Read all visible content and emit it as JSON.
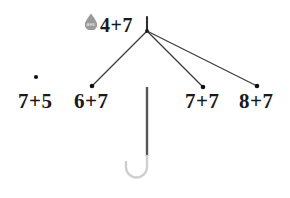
{
  "canvas": {
    "width": 290,
    "height": 198,
    "background": "#ffffff"
  },
  "colors": {
    "ink": "#1a1a1a",
    "branch": "#3a3a3a",
    "node": "#111111",
    "handle_shaft": "#555555",
    "handle_hook": "#cfcfcf",
    "droplet": "#9a9a9a",
    "droplet_label": "#ffffff"
  },
  "worksheet": {
    "title": "4+7",
    "root": {
      "label": "4+7",
      "x": 121,
      "y": 33
    },
    "icon": {
      "name": "water-droplet-icon",
      "label": "ARK",
      "x": 91,
      "y": 21
    },
    "vertex": {
      "x": 147,
      "y": 31
    },
    "top_stem": {
      "x": 147,
      "y1": 17,
      "y2": 31
    },
    "branches": [
      {
        "from_x": 147,
        "from_y": 31,
        "to_x": 92,
        "to_y": 86
      },
      {
        "from_x": 147,
        "from_y": 31,
        "to_x": 203,
        "to_y": 87
      },
      {
        "from_x": 147,
        "from_y": 31,
        "to_x": 257,
        "to_y": 86
      }
    ],
    "nodes": [
      {
        "label": "7+5",
        "dot_x": 36,
        "dot_y": 77,
        "text_x": 18,
        "text_y": 105,
        "connected": false
      },
      {
        "label": "6+7",
        "dot_x": 92,
        "dot_y": 86,
        "text_x": 74,
        "text_y": 105,
        "connected": true
      },
      {
        "label": "7+7",
        "dot_x": 203,
        "dot_y": 87,
        "text_x": 185,
        "text_y": 105,
        "connected": true
      },
      {
        "label": "8+7",
        "dot_x": 257,
        "dot_y": 86,
        "text_x": 239,
        "text_y": 105,
        "connected": true
      }
    ],
    "handle": {
      "shaft_x": 147,
      "shaft_y1": 87,
      "shaft_y2": 156,
      "hook_path": "M147,156 L147,168 A10,10 0 1,1 127,168 L127,164"
    }
  }
}
